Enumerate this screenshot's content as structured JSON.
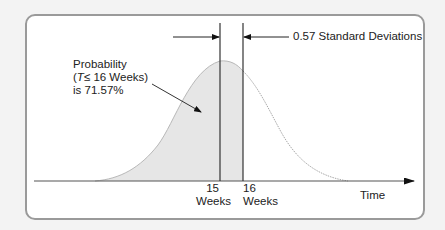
{
  "diagram": {
    "annotations": {
      "probability": {
        "line1": "Probability",
        "line2_open": "(",
        "line2_var": "T",
        "line2_rest": "≤  16 Weeks)",
        "line3": "is 71.57%"
      },
      "std_dev": "0.57 Standard Deviations"
    },
    "x_axis": {
      "label": "Time",
      "ticks": [
        {
          "value": "15",
          "unit": "Weeks"
        },
        {
          "value": "16",
          "unit": "Weeks"
        }
      ]
    },
    "colors": {
      "frame_border": "#9a9a9a",
      "shade": "#e6e6e6",
      "curve_left": "#b8b8b8",
      "curve_right": "#aaaaaa",
      "lines": "#333333",
      "background": "#f3f3f3"
    },
    "values": {
      "mean_weeks": 15,
      "target_weeks": 16,
      "z_score": 0.57,
      "probability_percent": 71.57
    }
  }
}
